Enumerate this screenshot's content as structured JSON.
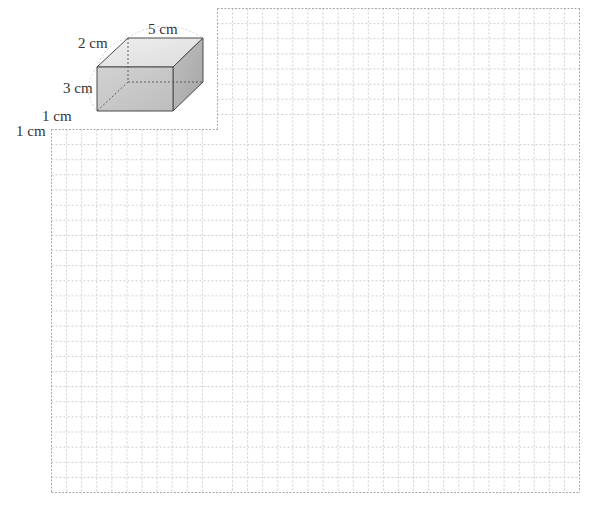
{
  "figure": {
    "cuboid": {
      "dimensions": {
        "length_label": "5 cm",
        "width_label": "2 cm",
        "height_label": "3 cm"
      },
      "colors": {
        "front": "#c9c9c9",
        "top": "#e6e6e6",
        "side": "#b3b3b3",
        "edge": "#4a4a4a"
      }
    },
    "grid": {
      "unit_label_horizontal": "1 cm",
      "unit_label_vertical": "1 cm",
      "columns": 35,
      "rows": 32,
      "cutout_columns": 11,
      "cutout_rows": 8,
      "line_color": "#cfcfcf",
      "border_color": "#a9a9a9"
    }
  }
}
